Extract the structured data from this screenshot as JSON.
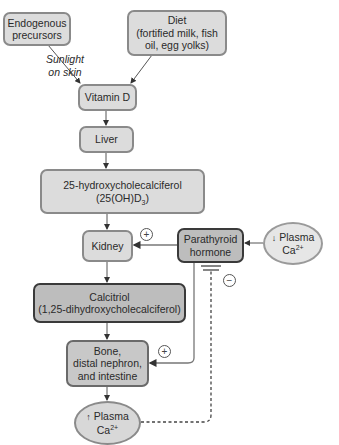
{
  "diagram": {
    "nodes": {
      "endogenous": {
        "line1": "Endogenous",
        "line2": "precursors"
      },
      "diet": {
        "line1": "Diet",
        "line2": "(fortified milk, fish",
        "line3": "oil, egg yolks)"
      },
      "sunlight": {
        "line1": "Sunlight",
        "line2": "on skin"
      },
      "vitamin_d": {
        "label": "Vitamin D"
      },
      "liver": {
        "label": "Liver"
      },
      "hydroxy": {
        "line1": "25-hydroxycholecalciferol",
        "line2_pre": "(25(OH)D",
        "line2_sub": "3",
        "line2_post": ")"
      },
      "kidney": {
        "label": "Kidney"
      },
      "pth": {
        "line1": "Parathyroid",
        "line2": "hormone"
      },
      "low_ca": {
        "arrow": "↓",
        "line1": "Plasma",
        "line2_pre": "Ca",
        "line2_sup": "2+"
      },
      "calcitriol": {
        "line1": "Calcitriol",
        "line2": "(1,25-dihydroxycholecalciferol)"
      },
      "targets": {
        "line1": "Bone,",
        "line2": "distal nephron,",
        "line3": "and intestine"
      },
      "high_ca": {
        "arrow": "↑",
        "line1": "Plasma",
        "line2_pre": "Ca",
        "line2_sup": "2+"
      }
    },
    "signs": {
      "pth_to_kidney": "+",
      "pth_to_targets": "+",
      "high_ca_inhibits_pth": "−"
    },
    "colors": {
      "light_fill": "#dcdcdc",
      "dark_fill": "#bdbdbd",
      "dark_border": "#3a3a3a",
      "light_border": "#8a8a8a",
      "line": "#555555"
    }
  }
}
